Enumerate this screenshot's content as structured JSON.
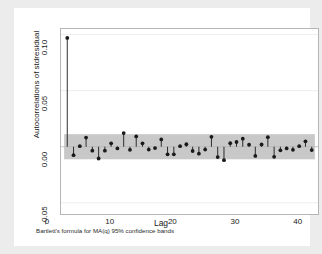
{
  "chart_data": {
    "type": "scatter",
    "title": "",
    "xlabel": "Lag",
    "ylabel": "Autocorrelations of stdresidual",
    "note": "Bartlett's formula for MA(q) 95% confidence bands",
    "xlim": [
      0,
      41
    ],
    "ylim": [
      -0.06,
      0.105
    ],
    "xticks": [
      0,
      10,
      20,
      30,
      40
    ],
    "xtick_labels": [
      "0",
      "10",
      "20",
      "30",
      "40"
    ],
    "yticks": [
      -0.05,
      0.0,
      0.05,
      0.1
    ],
    "ytick_labels": [
      "-0.05",
      "0.00",
      "0.05",
      "0.10"
    ],
    "grid": "horizontal-light",
    "legend": "none",
    "series_name": "Autocorrelations of stdresidual",
    "marker": "filled-circle",
    "marker_color": "#1a1a1a",
    "stem_color": "#1a1a1a",
    "band_color": "#c8c8c8",
    "band_label": "95% confidence band",
    "band_upper": 0.0112,
    "band_lower": -0.0112,
    "band_x_start": 0.5,
    "band_x_end": 40.5,
    "x": [
      1,
      2,
      3,
      4,
      5,
      6,
      7,
      8,
      9,
      10,
      11,
      12,
      13,
      14,
      15,
      16,
      17,
      18,
      19,
      20,
      21,
      22,
      23,
      24,
      25,
      26,
      27,
      28,
      29,
      30,
      31,
      32,
      33,
      34,
      35,
      36,
      37,
      38,
      39,
      40
    ],
    "values": [
      0.097,
      -0.0075,
      0.0005,
      0.0082,
      -0.0035,
      -0.0105,
      -0.0035,
      0.003,
      -0.0015,
      0.0122,
      -0.0028,
      0.0092,
      0.003,
      -0.0025,
      -0.0012,
      0.0065,
      -0.0068,
      -0.0068,
      0.0005,
      0.0022,
      -0.0038,
      -0.0062,
      -0.0025,
      0.0088,
      -0.0092,
      -0.012,
      0.0032,
      0.0042,
      0.0072,
      0.0018,
      -0.0082,
      0.002,
      0.0085,
      -0.009,
      -0.0032,
      -0.0015,
      -0.0028,
      0.0005,
      0.0048,
      -0.003
    ]
  },
  "axis": {
    "y_title": "Autocorrelations of stdresidual",
    "x_title": "Lag"
  },
  "footnote": {
    "text": "Bartlett's formula for MA(q) 95% confidence bands"
  }
}
